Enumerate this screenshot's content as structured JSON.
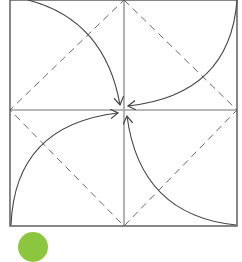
{
  "diagram": {
    "type": "origami-fold-diagram",
    "colors": {
      "outline": "#555555",
      "crease": "#a0a0a0",
      "dashed": "#666666",
      "arrow": "#444444",
      "badge": "#8cc63f"
    },
    "square": {
      "x1": 10,
      "y1": 0,
      "x2": 237,
      "y2": 226
    },
    "center": {
      "x": 124,
      "y": 110
    },
    "arrows": [
      {
        "name": "top-left-corner-arrow",
        "from": "top-left",
        "to": "center"
      },
      {
        "name": "top-right-corner-arrow",
        "from": "top-right",
        "to": "center"
      },
      {
        "name": "bottom-left-corner-arrow",
        "from": "bottom-left",
        "to": "center"
      },
      {
        "name": "bottom-right-corner-arrow",
        "from": "bottom-right",
        "to": "center"
      }
    ]
  },
  "step_badge": {
    "label": ""
  }
}
